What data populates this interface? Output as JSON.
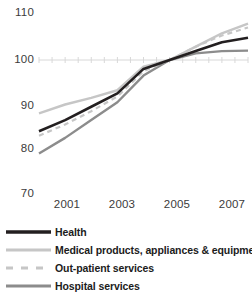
{
  "chart_data": {
    "type": "line",
    "title": "",
    "subtitle": "",
    "xlabel": "",
    "ylabel": "",
    "x": [
      2000,
      2001,
      2002,
      2003,
      2004,
      2005,
      2006,
      2007,
      2008
    ],
    "xlim": [
      2000,
      2008
    ],
    "ylim": [
      70,
      110
    ],
    "yticks": [
      70,
      80,
      90,
      100,
      110
    ],
    "ytick_labels": [
      "70",
      "80",
      "90",
      "100",
      "110"
    ],
    "xticks": [
      2001,
      2003,
      2005,
      2007
    ],
    "xtick_labels": [
      "2001",
      "2003",
      "2005",
      "2007"
    ],
    "grid": "single horizontal gridline at 100",
    "gridline_value": 100,
    "legend_position": "below-plot",
    "series": [
      {
        "name": "Health",
        "color": "#231f20",
        "style": "solid",
        "width": 2.6,
        "values": [
          84.0,
          86.5,
          89.5,
          92.5,
          98.0,
          100.0,
          102.0,
          104.0,
          105.0
        ]
      },
      {
        "name": "Medical products, appliances & equipment",
        "color": "#c6c6c6",
        "style": "solid",
        "width": 2.4,
        "values": [
          88.0,
          90.0,
          91.5,
          93.2,
          98.5,
          100.0,
          103.0,
          106.0,
          108.2
        ]
      },
      {
        "name": "Out-patient services",
        "color": "#c6c6c6",
        "style": "dashed",
        "width": 2.2,
        "values": [
          83.0,
          85.5,
          88.5,
          91.8,
          97.5,
          100.0,
          103.0,
          105.5,
          107.3
        ]
      },
      {
        "name": "Hospital services",
        "color": "#8c8c8c",
        "style": "solid",
        "width": 2.4,
        "values": [
          79.0,
          82.5,
          86.5,
          90.5,
          96.5,
          100.0,
          101.5,
          102.0,
          102.1
        ]
      }
    ]
  },
  "axis": {
    "y_labels": [
      "110",
      "100",
      "90",
      "80",
      "70"
    ],
    "x_labels": [
      "2001",
      "2003",
      "2005",
      "2007"
    ]
  },
  "legend": {
    "items": [
      {
        "label": "Health",
        "swatch": "solid-black-line-icon"
      },
      {
        "label": "Medical products, appliances & equipment",
        "swatch": "solid-lightgray-line-icon"
      },
      {
        "label": "Out-patient services",
        "swatch": "dashed-lightgray-line-icon"
      },
      {
        "label": "Hospital services",
        "swatch": "solid-gray-line-icon"
      }
    ]
  },
  "colors": {
    "health": "#231f20",
    "medical_products": "#c6c6c6",
    "out_patient": "#c6c6c6",
    "hospital": "#8c8c8c",
    "gridline": "#d8d8d8",
    "text": "#3b3b3b"
  }
}
